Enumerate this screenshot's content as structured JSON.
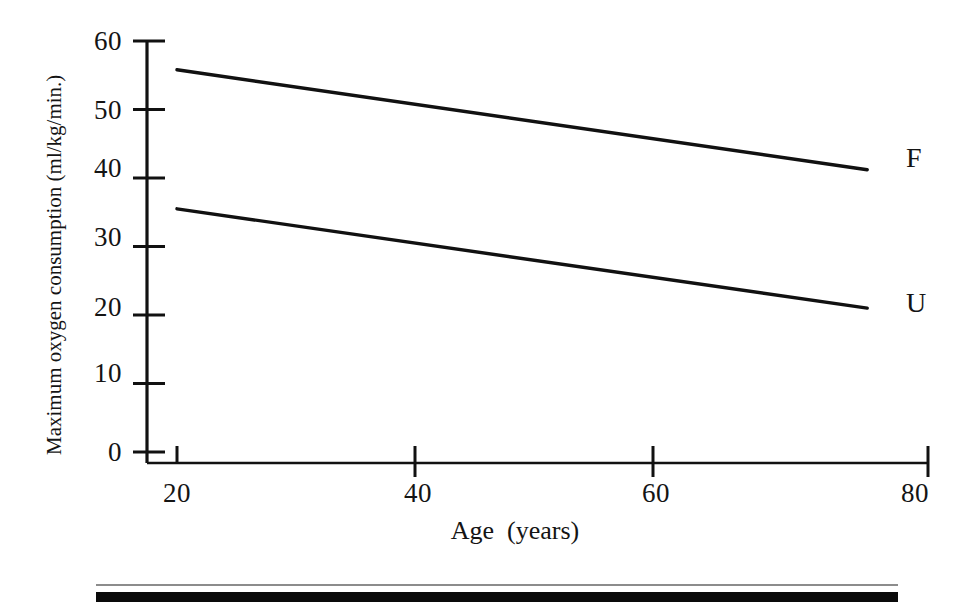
{
  "chart_data": {
    "type": "line",
    "title": "",
    "xlabel": "Age  (years)",
    "ylabel": "Maximum oxygen consumption (ml/kg/min.)",
    "xlim": [
      20,
      80
    ],
    "ylim": [
      0,
      60
    ],
    "xticks": [
      "20",
      "40",
      "60",
      "80"
    ],
    "xtick_values": [
      20,
      40,
      60,
      80
    ],
    "yticks": [
      "0",
      "10",
      "20",
      "30",
      "40",
      "50",
      "60"
    ],
    "ytick_values": [
      0,
      10,
      20,
      30,
      40,
      50,
      60
    ],
    "grid": false,
    "legend_position": "right-end-of-line",
    "series": [
      {
        "name": "F",
        "label": "F",
        "color": "#111111",
        "x": [
          20,
          78
        ],
        "values": [
          55.8,
          41.2
        ]
      },
      {
        "name": "U",
        "label": "U",
        "color": "#111111",
        "x": [
          20,
          78
        ],
        "values": [
          35.5,
          21.0
        ]
      }
    ]
  },
  "axes": {
    "y_axis_name": "Maximum oxygen consumption (ml/kg/min.)",
    "x_axis_name": "Age  (years)"
  },
  "footer": {
    "rule_thin_color": "#8c8c8c",
    "rule_thick_color": "#0a0a0a"
  }
}
